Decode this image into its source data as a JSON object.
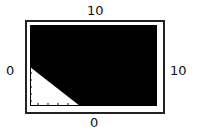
{
  "labels": {
    "top": "10",
    "left": "0",
    "right": "10",
    "bottom": "0"
  },
  "colors": {
    "field": "#000000",
    "region": "#ffffff",
    "frame": "#222222"
  },
  "region": {
    "shape": "triangle",
    "corner": "lower-left"
  }
}
